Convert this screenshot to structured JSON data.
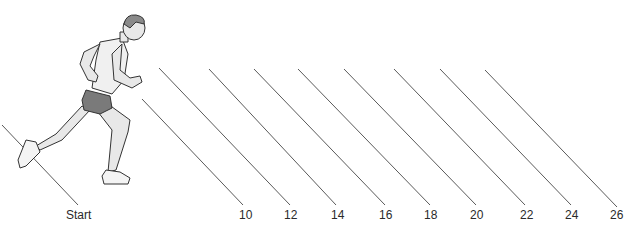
{
  "diagram": {
    "line_color": "#5a5a5a",
    "runner": {
      "skin": "#e8e8e8",
      "shorts": "#7a7a7a",
      "hair": "#8a8a8a",
      "outline": "#333333"
    },
    "markers": [
      {
        "label": "Start",
        "x1": 2,
        "y1": 125,
        "x2": 78,
        "y2": 205,
        "lx": 66,
        "ly": 209
      },
      {
        "label": "10",
        "x1": 142,
        "y1": 99,
        "x2": 243,
        "y2": 205,
        "lx": 239,
        "ly": 209
      },
      {
        "label": "12",
        "x1": 159,
        "y1": 68,
        "x2": 290,
        "y2": 205,
        "lx": 284,
        "ly": 209
      },
      {
        "label": "14",
        "x1": 209,
        "y1": 69,
        "x2": 336,
        "y2": 205,
        "lx": 331,
        "ly": 209
      },
      {
        "label": "16",
        "x1": 254,
        "y1": 69,
        "x2": 385,
        "y2": 205,
        "lx": 379,
        "ly": 209
      },
      {
        "label": "18",
        "x1": 298,
        "y1": 69,
        "x2": 430,
        "y2": 205,
        "lx": 424,
        "ly": 209
      },
      {
        "label": "20",
        "x1": 344,
        "y1": 69,
        "x2": 476,
        "y2": 205,
        "lx": 470,
        "ly": 209
      },
      {
        "label": "22",
        "x1": 394,
        "y1": 69,
        "x2": 525,
        "y2": 205,
        "lx": 520,
        "ly": 209
      },
      {
        "label": "24",
        "x1": 440,
        "y1": 69,
        "x2": 571,
        "y2": 205,
        "lx": 565,
        "ly": 209
      },
      {
        "label": "26",
        "x1": 485,
        "y1": 70,
        "x2": 617,
        "y2": 207,
        "lx": 610,
        "ly": 209
      }
    ]
  }
}
